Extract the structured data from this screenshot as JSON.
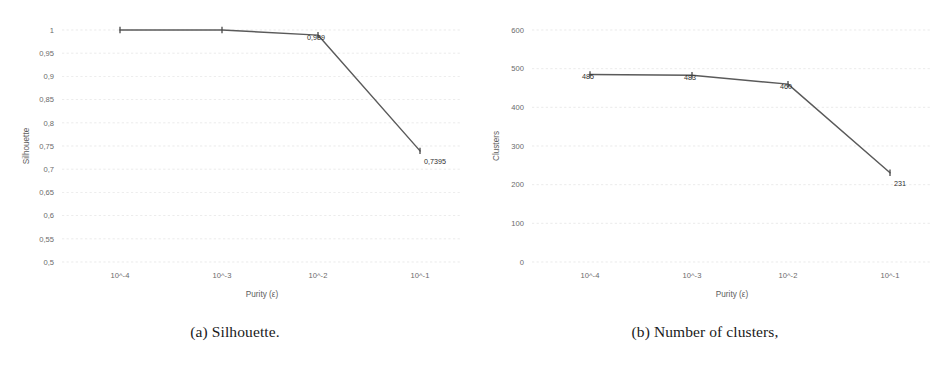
{
  "figure": {
    "panels": [
      {
        "caption": "(a) Silhouette.",
        "chart_ref": 0
      },
      {
        "caption": "(b) Number of clusters,",
        "chart_ref": 1
      }
    ]
  },
  "chart_data": [
    {
      "type": "line",
      "title": "",
      "xlabel": "Purity (ε)",
      "ylabel": "Silhouette",
      "categories": [
        "10^-4",
        "10^-3",
        "10^-2",
        "10^-1"
      ],
      "values": [
        1,
        1,
        0.989,
        0.7395
      ],
      "point_labels": [
        "",
        "",
        "0,989",
        "0,7395"
      ],
      "yticks": [
        "1",
        "0,95",
        "0,9",
        "0,85",
        "0,8",
        "0,75",
        "0,7",
        "0,65",
        "0,6",
        "0,55",
        "0,5"
      ],
      "ytick_values": [
        1,
        0.95,
        0.9,
        0.85,
        0.8,
        0.75,
        0.7,
        0.65,
        0.6,
        0.55,
        0.5
      ],
      "ylim": [
        0.5,
        1.0
      ],
      "grid": true,
      "legend": "none",
      "line_color": "#5a5a5a",
      "marker": "tick"
    },
    {
      "type": "line",
      "title": "",
      "xlabel": "Purity (ε)",
      "ylabel": "Clusters",
      "categories": [
        "10^-4",
        "10^-3",
        "10^-2",
        "10^-1"
      ],
      "values": [
        485,
        483,
        460,
        231
      ],
      "point_labels": [
        "485",
        "483",
        "460",
        "231"
      ],
      "yticks": [
        "600",
        "500",
        "400",
        "300",
        "200",
        "100",
        "0"
      ],
      "ytick_values": [
        600,
        500,
        400,
        300,
        200,
        100,
        0
      ],
      "ylim": [
        0,
        600
      ],
      "grid": true,
      "legend": "none",
      "line_color": "#5a5a5a",
      "marker": "tick"
    }
  ]
}
